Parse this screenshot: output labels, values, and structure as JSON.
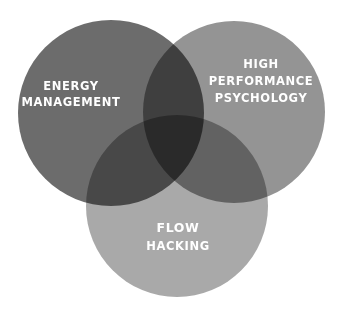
{
  "diagram": {
    "type": "venn-3",
    "sets": [
      {
        "id": "energy",
        "label_lines": [
          "ENERGY",
          "MANAGEMENT"
        ],
        "fill": "#6c6c6c",
        "position": "top-left"
      },
      {
        "id": "performance",
        "label_lines": [
          "HIGH",
          "PERFORMANCE",
          "PSYCHOLOGY"
        ],
        "fill": "#949494",
        "position": "top-right"
      },
      {
        "id": "flow",
        "label_lines": [
          "FLOW",
          "HACKING"
        ],
        "fill": "#a9a9a9",
        "position": "bottom-center"
      }
    ],
    "text_color": "#ffffff",
    "background": "#ffffff"
  }
}
